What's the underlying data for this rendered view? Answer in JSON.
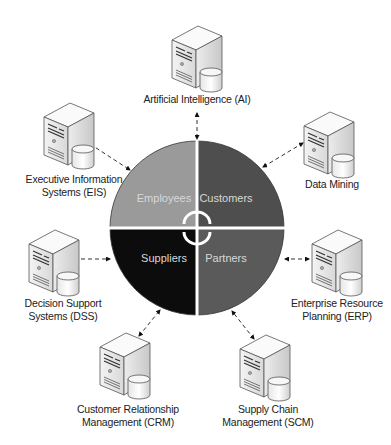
{
  "diagram": {
    "center": {
      "icon": "cycle-arrows-icon",
      "quadrants": [
        {
          "label": "Employees",
          "color": "#9a9a9a"
        },
        {
          "label": "Customers",
          "color": "#4e4e4e"
        },
        {
          "label": "Suppliers",
          "color": "#0c0c0c"
        },
        {
          "label": "Partners",
          "color": "#5a5a5a"
        }
      ]
    },
    "systems": [
      {
        "id": "ai",
        "label": "Artificial Intelligence (AI)",
        "icon": "server-database-icon"
      },
      {
        "id": "dm",
        "label": "Data Mining",
        "icon": "server-database-icon"
      },
      {
        "id": "erp",
        "label": "Enterprise Resource Planning (ERP)",
        "line1": "Enterprise Resource",
        "line2": "Planning (ERP)",
        "icon": "server-database-icon"
      },
      {
        "id": "scm",
        "label": "Supply Chain Management (SCM)",
        "line1": "Supply Chain",
        "line2": "Management (SCM)",
        "icon": "server-database-icon"
      },
      {
        "id": "crm",
        "label": "Customer Relationship Management (CRM)",
        "line1": "Customer Relationship",
        "line2": "Management (CRM)",
        "icon": "server-database-icon"
      },
      {
        "id": "dss",
        "label": "Decision Support Systems (DSS)",
        "line1": "Decision Support",
        "line2": "Systems (DSS)",
        "icon": "server-database-icon"
      },
      {
        "id": "eis",
        "label": "Executive Information Systems (EIS)",
        "line1": "Executive Information",
        "line2": "Systems (EIS)",
        "icon": "server-database-icon"
      }
    ],
    "connector_style": "dashed-double-arrow"
  }
}
